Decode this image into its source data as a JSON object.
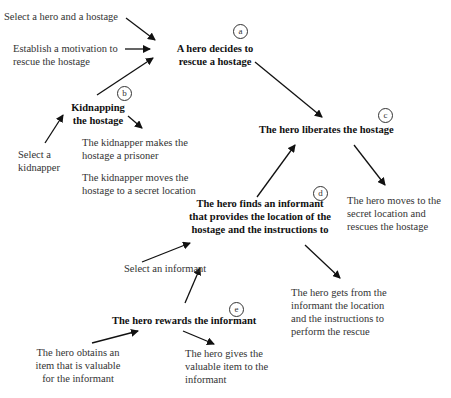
{
  "diagram": {
    "nodes": {
      "a": {
        "label": "a",
        "text": "A hero decides to\nrescue a hostage"
      },
      "b": {
        "label": "b",
        "text": "Kidnapping\nthe hostage"
      },
      "c": {
        "label": "c",
        "text": "The hero liberates the hostage"
      },
      "d": {
        "label": "d",
        "text": "The  hero  finds an informant\nthat provides the location of the\nhostage and the instructions to"
      },
      "e": {
        "label": "e",
        "text": "The hero rewards the informant"
      }
    },
    "inputs": {
      "select_hero_hostage": "Select a hero and a hostage",
      "establish_motivation": "Establish a motivation to\nrescue the hostage",
      "select_kidnapper": "Select a\nkidnapper",
      "select_informant": "Select an informant",
      "obtain_item": "The hero obtains an\nitem that is valuable\nfor the informant"
    },
    "outputs": {
      "kidnapper_prisoner": "The kidnapper makes the\nhostage a prisoner",
      "kidnapper_moves": "The kidnapper moves the\nhostage to a secret location",
      "hero_moves": "The hero moves to the\nsecret location and\nrescues the hostage",
      "hero_gets": "The hero gets from the\ninformant the location\nand the instructions to\nperform the rescue",
      "hero_gives": "The hero gives the\nvaluable item to the\ninformant"
    },
    "colors": {
      "text": "#333333",
      "bold_text": "#111111",
      "arrow": "#111111",
      "background": "#ffffff"
    }
  }
}
